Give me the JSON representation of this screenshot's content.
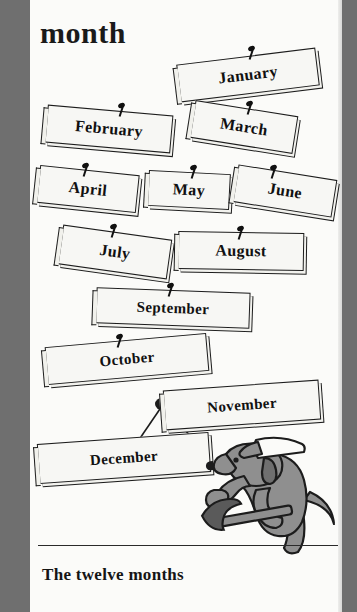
{
  "page": {
    "headword": "month",
    "caption": "The twelve months",
    "paper_color": "#fbfbf9",
    "background_color": "#6f6f6f",
    "ink_color": "#1c1c1c",
    "dog_color": "#8f8f8f"
  },
  "signs": [
    {
      "label": "January",
      "left": 148,
      "top": 56,
      "width": 140,
      "height": 38,
      "rotate": -7,
      "font_size": 16,
      "nail_left": 218,
      "nail_top": 46
    },
    {
      "label": "February",
      "left": 16,
      "top": 110,
      "width": 126,
      "height": 38,
      "rotate": 5,
      "font_size": 16,
      "nail_left": 88,
      "nail_top": 103
    },
    {
      "label": "March",
      "left": 162,
      "top": 108,
      "width": 104,
      "height": 38,
      "rotate": 9,
      "font_size": 16,
      "nail_left": 216,
      "nail_top": 101
    },
    {
      "label": "April",
      "left": 8,
      "top": 170,
      "width": 100,
      "height": 38,
      "rotate": 6,
      "font_size": 16,
      "nail_left": 52,
      "nail_top": 163
    },
    {
      "label": "May",
      "left": 118,
      "top": 172,
      "width": 82,
      "height": 36,
      "rotate": 3,
      "font_size": 16,
      "nail_left": 160,
      "nail_top": 165
    },
    {
      "label": "June",
      "left": 205,
      "top": 172,
      "width": 100,
      "height": 38,
      "rotate": 9,
      "font_size": 16,
      "nail_left": 240,
      "nail_top": 165
    },
    {
      "label": "July",
      "left": 30,
      "top": 232,
      "width": 110,
      "height": 40,
      "rotate": 8,
      "font_size": 16,
      "nail_left": 80,
      "nail_top": 224
    },
    {
      "label": "August",
      "left": 148,
      "top": 232,
      "width": 126,
      "height": 38,
      "rotate": 1,
      "font_size": 16,
      "nail_left": 207,
      "nail_top": 226
    },
    {
      "label": "September",
      "left": 66,
      "top": 290,
      "width": 154,
      "height": 36,
      "rotate": 2,
      "font_size": 15,
      "nail_left": 137,
      "nail_top": 283
    },
    {
      "label": "October",
      "left": 16,
      "top": 340,
      "width": 162,
      "height": 38,
      "rotate": -5,
      "font_size": 15,
      "nail_left": 86,
      "nail_top": 334
    },
    {
      "label": "November",
      "left": 134,
      "top": 385,
      "width": 156,
      "height": 40,
      "rotate": -4,
      "font_size": 15,
      "nail_left": -99,
      "nail_top": -99
    },
    {
      "label": "December",
      "left": 8,
      "top": 438,
      "width": 172,
      "height": 40,
      "rotate": -4,
      "font_size": 15,
      "nail_left": -99,
      "nail_top": -99
    }
  ],
  "illustration": {
    "dog_name": "dog-with-hammer",
    "hammer_name": "hammer",
    "cap_name": "dog-cap",
    "hanger_name": "december-sign-hanger"
  }
}
